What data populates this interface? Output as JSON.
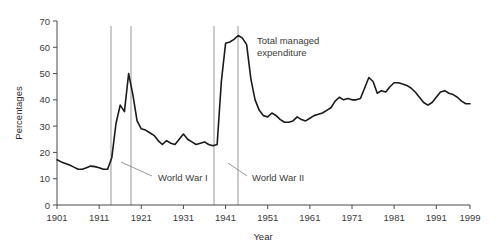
{
  "chart_data": {
    "type": "line",
    "title": "",
    "xlabel": "Year",
    "ylabel": "Percentages",
    "xlim": [
      1901,
      1999
    ],
    "ylim": [
      0,
      70
    ],
    "grid": false,
    "legend_position": "none",
    "xticks": [
      1901,
      1911,
      1921,
      1931,
      1941,
      1951,
      1961,
      1971,
      1981,
      1991,
      1999
    ],
    "xtick_labels": [
      "1901",
      "1911",
      "1921",
      "1931",
      "1941",
      "1951",
      "1961",
      "1971",
      "1981",
      "1991",
      "1999"
    ],
    "yticks": [
      0,
      10,
      20,
      30,
      40,
      50,
      60,
      70
    ],
    "ytick_labels": [
      "0",
      "10",
      "20",
      "30",
      "40",
      "50",
      "60",
      "70"
    ],
    "series": [
      {
        "name": "Total managed expenditure",
        "color": "#1a1a1a",
        "x": [
          1901,
          1902,
          1903,
          1904,
          1905,
          1906,
          1907,
          1908,
          1909,
          1910,
          1911,
          1912,
          1913,
          1914,
          1915,
          1916,
          1917,
          1918,
          1919,
          1920,
          1921,
          1922,
          1923,
          1924,
          1925,
          1926,
          1927,
          1928,
          1929,
          1930,
          1931,
          1932,
          1933,
          1934,
          1935,
          1936,
          1937,
          1938,
          1939,
          1940,
          1941,
          1942,
          1943,
          1944,
          1945,
          1946,
          1947,
          1948,
          1949,
          1950,
          1951,
          1952,
          1953,
          1954,
          1955,
          1956,
          1957,
          1958,
          1959,
          1960,
          1961,
          1962,
          1963,
          1964,
          1965,
          1966,
          1967,
          1968,
          1969,
          1970,
          1971,
          1972,
          1973,
          1974,
          1975,
          1976,
          1977,
          1978,
          1979,
          1980,
          1981,
          1982,
          1983,
          1984,
          1985,
          1986,
          1987,
          1988,
          1989,
          1990,
          1991,
          1992,
          1993,
          1994,
          1995,
          1996,
          1997,
          1998,
          1999
        ],
        "values": [
          17.2,
          16.4,
          15.8,
          15.2,
          14.4,
          13.6,
          13.6,
          14.2,
          14.8,
          14.6,
          14.2,
          13.6,
          13.6,
          18.0,
          31.0,
          38.0,
          35.5,
          50.0,
          42.0,
          32.0,
          29.0,
          28.5,
          27.5,
          26.5,
          24.5,
          23.0,
          24.5,
          23.5,
          23.0,
          25.0,
          27.0,
          25.0,
          24.0,
          23.0,
          23.5,
          24.0,
          23.0,
          22.5,
          23.0,
          47.0,
          61.5,
          62.0,
          63.0,
          64.5,
          63.5,
          61.0,
          48.0,
          40.0,
          36.0,
          34.0,
          33.5,
          35.0,
          34.0,
          32.5,
          31.5,
          31.5,
          32.0,
          33.5,
          32.5,
          32.0,
          33.0,
          34.0,
          34.5,
          35.0,
          36.0,
          37.0,
          39.5,
          41.0,
          40.0,
          40.5,
          40.0,
          40.0,
          40.5,
          44.5,
          48.5,
          47.0,
          42.5,
          43.5,
          43.0,
          45.0,
          46.5,
          46.5,
          46.0,
          45.5,
          44.5,
          43.0,
          41.0,
          39.0,
          38.0,
          39.0,
          41.0,
          43.0,
          43.5,
          42.5,
          42.0,
          41.0,
          39.5,
          38.5,
          38.5
        ]
      }
    ],
    "annotations": [
      {
        "id": "series-label",
        "text": "Total managed expenditure",
        "lines": [
          "Total managed",
          "expenditure"
        ],
        "x_px": 257,
        "y_px": 40
      },
      {
        "id": "ww1-label",
        "text": "World War I",
        "x_px": 158,
        "y_px": 178
      },
      {
        "id": "ww2-label",
        "text": "World War II",
        "x_px": 252,
        "y_px": 178
      }
    ],
    "event_markers": [
      {
        "label": "World War I start",
        "year": 1914,
        "x_px": 111
      },
      {
        "label": "World War I end",
        "year": 1919,
        "x_px": 131
      },
      {
        "label": "World War II start",
        "year": 1939,
        "x_px": 214
      },
      {
        "label": "World War II end",
        "year": 1945,
        "x_px": 238
      }
    ],
    "leader_lines": [
      {
        "id": "ww1-leader",
        "x1": 121,
        "y1": 162,
        "x2": 152,
        "y2": 176
      },
      {
        "id": "ww2-leader",
        "x1": 228,
        "y1": 163,
        "x2": 247,
        "y2": 176
      }
    ],
    "colors": {
      "line": "#1a1a1a",
      "axis": "#4a4a4a",
      "marker_line": "#8c8c8c",
      "text": "#3a3a3a",
      "background": "#ffffff"
    },
    "plot_area_px": {
      "left": 57,
      "right": 470,
      "top": 21,
      "bottom": 205
    }
  }
}
